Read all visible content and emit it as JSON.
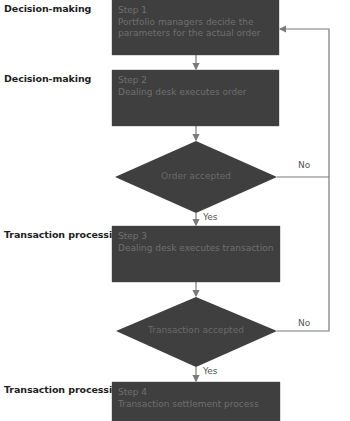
{
  "lanes": {
    "l1": "Decision-making",
    "l2": "Decision-making",
    "l3": "Transaction processing",
    "l4": "Transaction processing"
  },
  "steps": [
    {
      "title": "Step 1",
      "text": "Portfolio managers decide the parameters for the actual order",
      "line1": "Portfolio managers decide the",
      "line2": "parameters for the actual order"
    },
    {
      "title": "Step 2",
      "text": "Dealing desk executes order"
    },
    {
      "title": "Step 3",
      "text": "Dealing desk executes transaction"
    },
    {
      "title": "Step 4",
      "text": "Transaction settlement process"
    }
  ],
  "decisions": [
    {
      "text": "Order accepted",
      "yes": "Yes",
      "no": "No"
    },
    {
      "text": "Transaction accepted",
      "yes": "Yes",
      "no": "No"
    }
  ],
  "colors": {
    "box_fill": "#3f3f3f",
    "line": "#7a7a7a"
  }
}
